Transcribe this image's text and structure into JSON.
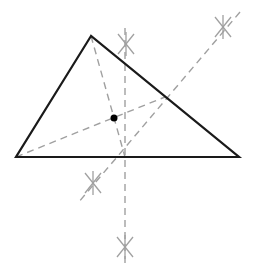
{
  "diagram": {
    "type": "geometric-construction",
    "colors": {
      "background": "#ffffff",
      "triangle_stroke": "#1a1a1a",
      "construction_stroke": "#a0a0a0",
      "point_fill": "#000000"
    },
    "triangle": {
      "vertices": [
        [
          91,
          36
        ],
        [
          16,
          157
        ],
        [
          239,
          157
        ]
      ]
    },
    "point": {
      "x": 114,
      "y": 118,
      "r": 3.5
    },
    "dashed_lines": [
      {
        "name": "median-from-top-vertex",
        "x1": 91,
        "y1": 36,
        "x2": 125,
        "y2": 157
      },
      {
        "name": "median-from-left-vertex",
        "x1": 16,
        "y1": 157,
        "x2": 165,
        "y2": 97
      },
      {
        "name": "bisector-right-side",
        "x1": 240,
        "y1": 12,
        "x2": 78,
        "y2": 203
      },
      {
        "name": "bisector-base",
        "x1": 125,
        "y1": 28,
        "x2": 125,
        "y2": 265
      }
    ],
    "arc_marks": [
      {
        "name": "arc-mark-top",
        "x": 126,
        "y": 44
      },
      {
        "name": "arc-mark-top-right",
        "x": 223,
        "y": 27
      },
      {
        "name": "arc-mark-lower-left",
        "x": 93,
        "y": 183
      },
      {
        "name": "arc-mark-bottom",
        "x": 125,
        "y": 247
      }
    ]
  }
}
